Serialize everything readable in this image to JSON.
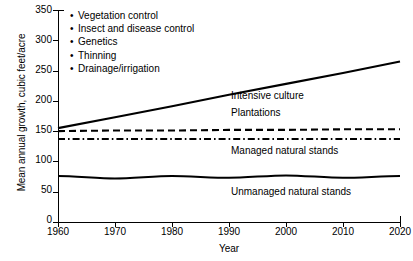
{
  "chart_data": {
    "type": "line",
    "title": "",
    "xlabel": "Year",
    "ylabel": "Mean annual growth, cubic feet/acre",
    "xlim": [
      1960,
      2020
    ],
    "ylim": [
      0,
      350
    ],
    "xticks": [
      1960,
      1970,
      1980,
      1990,
      2000,
      2010,
      2020
    ],
    "yticks": [
      0,
      50,
      100,
      150,
      200,
      250,
      300,
      350
    ],
    "grid": false,
    "legend_position": "upper-left-inside",
    "x": [
      1960,
      1970,
      1980,
      1990,
      2000,
      2010,
      2020
    ],
    "series": [
      {
        "name": "Intensive culture",
        "style": "solid",
        "label_position": "right-of-line",
        "values": [
          155,
          173,
          191,
          210,
          228,
          246,
          265
        ]
      },
      {
        "name": "Plantations",
        "style": "dashed",
        "label_position": "above-line",
        "values": [
          150,
          151,
          151,
          152,
          152,
          153,
          153
        ]
      },
      {
        "name": "Managed natural stands",
        "style": "dash-dot",
        "label_position": "below-line",
        "values": [
          137,
          137,
          137,
          137,
          137,
          137,
          137
        ]
      },
      {
        "name": "Unmanaged natural stands",
        "style": "solid-wavy",
        "label_position": "below-line",
        "values": [
          76,
          72,
          76,
          73,
          77,
          73,
          76
        ]
      }
    ],
    "legend_entries": [
      "Vegetation control",
      "Insect and disease control",
      "Genetics",
      "Thinning",
      "Drainage/irrigation"
    ],
    "annotations": []
  },
  "colors": {
    "line": "#000000",
    "axis": "#000000",
    "background": "#ffffff"
  }
}
